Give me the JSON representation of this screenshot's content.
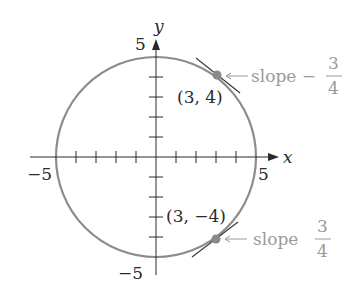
{
  "diagram": {
    "type": "circle-with-tangents",
    "equation": "x^2 + y^2 = 25",
    "axes": {
      "x_label": "x",
      "y_label": "y",
      "x_min_label": "−5",
      "x_max_label": "5",
      "y_max_label": "5",
      "y_min_label": "−5"
    },
    "points": [
      {
        "label": "(3, 4)",
        "x": 3,
        "y": 4,
        "slope_text": "slope −",
        "slope_num": "3",
        "slope_den": "4"
      },
      {
        "label": "(3, −4)",
        "x": 3,
        "y": -4,
        "slope_text": "slope",
        "slope_num": "3",
        "slope_den": "4"
      }
    ],
    "colors": {
      "circle": "#8c8c8c",
      "axes": "#2a2a2a",
      "annotation": "#9a9a9a",
      "point": "#8a8a8a"
    }
  }
}
